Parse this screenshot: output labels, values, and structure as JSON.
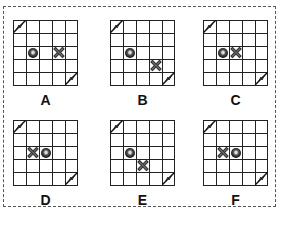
{
  "grid": {
    "rows": 5,
    "cols": 5
  },
  "corner_icons": [
    {
      "icon": "lightning-icon",
      "row": 0,
      "col": 0
    },
    {
      "icon": "lightning-icon",
      "row": 4,
      "col": 4
    }
  ],
  "options": [
    {
      "label": "A",
      "ball": {
        "row": 2,
        "col": 1
      },
      "x_mark": {
        "row": 2,
        "col": 3
      }
    },
    {
      "label": "B",
      "ball": {
        "row": 2,
        "col": 1
      },
      "x_mark": {
        "row": 3,
        "col": 3
      }
    },
    {
      "label": "C",
      "ball": {
        "row": 2,
        "col": 1
      },
      "x_mark": {
        "row": 2,
        "col": 2
      }
    },
    {
      "label": "D",
      "ball": {
        "row": 2,
        "col": 2
      },
      "x_mark": {
        "row": 2,
        "col": 1
      }
    },
    {
      "label": "E",
      "ball": {
        "row": 2,
        "col": 1
      },
      "x_mark": {
        "row": 3,
        "col": 2
      }
    },
    {
      "label": "F",
      "ball": {
        "row": 2,
        "col": 2
      },
      "x_mark": {
        "row": 2,
        "col": 1
      }
    }
  ]
}
